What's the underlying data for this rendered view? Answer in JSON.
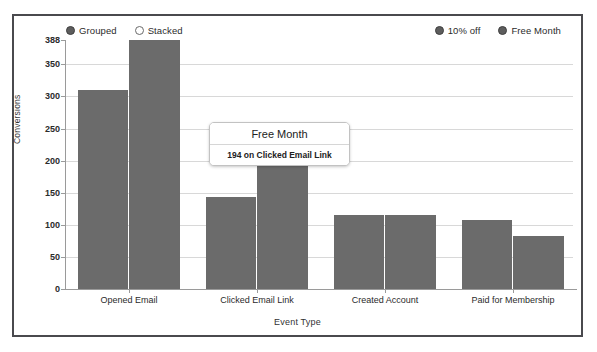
{
  "chart_data": {
    "type": "bar",
    "title": "",
    "xlabel": "Event Type",
    "ylabel": "Conversions",
    "categories": [
      "Opened Email",
      "Clicked Email Link",
      "Created Account",
      "Paid for Membership"
    ],
    "series": [
      {
        "name": "10% off",
        "values": [
          310,
          144,
          115,
          108
        ]
      },
      {
        "name": "Free Month",
        "values": [
          388,
          194,
          115,
          83
        ]
      }
    ],
    "ylim": [
      0,
      388
    ],
    "yticks": [
      0,
      50,
      100,
      150,
      200,
      250,
      300,
      350
    ],
    "ytick_labels": [
      "0",
      "50",
      "100",
      "150",
      "200",
      "250",
      "300",
      "350"
    ],
    "ymax_label": "388",
    "grid": true,
    "legend_position": "top",
    "bar_color": "#6b6b6b"
  },
  "legend_control": {
    "items": [
      {
        "label": "Grouped",
        "marker": "filled-circle-icon",
        "selected": true
      },
      {
        "label": "Stacked",
        "marker": "hollow-circle-icon",
        "selected": false
      }
    ]
  },
  "legend_series": {
    "items": [
      {
        "label": "10% off",
        "marker": "filled-circle-icon",
        "color": "#5d5d5d"
      },
      {
        "label": "Free Month",
        "marker": "filled-circle-icon",
        "color": "#5d5d5d"
      }
    ]
  },
  "tooltip": {
    "title": "Free Month",
    "body": "194 on Clicked Email Link"
  }
}
